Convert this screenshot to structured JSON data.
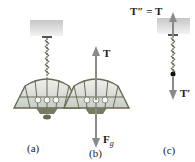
{
  "figure": {
    "panels": [
      {
        "id": "a",
        "caption": "(a)"
      },
      {
        "id": "b",
        "caption": "(b)",
        "force_up": "T",
        "force_down_main": "F",
        "force_down_sub": "g"
      },
      {
        "id": "c",
        "caption": "(c)",
        "force_up": "T″ = T",
        "force_down": "T′"
      }
    ],
    "colors": {
      "ceiling_top": "#c9c9c9",
      "ceiling_bottom": "#f2f2f2",
      "chain": "#6a6a5a",
      "lamp_frame": "#6b6a52",
      "lamp_glass": "#d9ddd8",
      "arrow": "#8a8a8a",
      "point": "#111111"
    }
  }
}
